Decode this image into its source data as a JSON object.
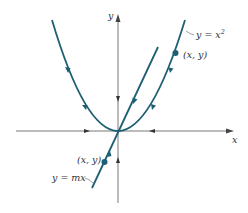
{
  "diagram": {
    "axes": {
      "x_label": "x",
      "y_label": "y"
    },
    "curves": {
      "parabola": {
        "label_lhs": "y = x",
        "label_sup": "2",
        "point_label": "(x, y)"
      },
      "line": {
        "label": "y = mx",
        "point_label": "(x, y)"
      }
    },
    "colors": {
      "curve": "#1f5f73",
      "axis": "#555555",
      "background": "#ffffff"
    }
  }
}
